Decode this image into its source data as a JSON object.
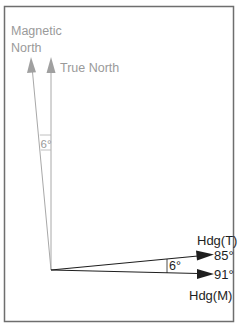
{
  "diagram": {
    "type": "compass-heading-variation",
    "north_labels": {
      "magnetic_line1": "Magnetic",
      "magnetic_line2": "North",
      "true": "True North"
    },
    "variation_angle_north": "6°",
    "headings": {
      "true_label": "Hdg(T)",
      "true_value": "85°",
      "magnetic_label": "Hdg(M)",
      "magnetic_value": "91°"
    },
    "variation_angle_heading": "6°",
    "colors": {
      "north_lines": "#9a9a9a",
      "heading_lines": "#1e1e1e",
      "frame": "#6e6e6e"
    }
  }
}
